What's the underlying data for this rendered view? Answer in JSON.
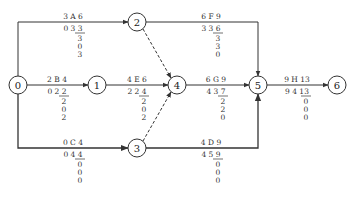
{
  "diagram": {
    "type": "activity-on-arrow network",
    "nodes": [
      {
        "id": "0",
        "x": 18,
        "y": 85
      },
      {
        "id": "1",
        "x": 97,
        "y": 85
      },
      {
        "id": "2",
        "x": 137,
        "y": 22
      },
      {
        "id": "3",
        "x": 137,
        "y": 148
      },
      {
        "id": "4",
        "x": 177,
        "y": 85
      },
      {
        "id": "5",
        "x": 258,
        "y": 85
      },
      {
        "id": "6",
        "x": 337,
        "y": 85
      }
    ],
    "activities": [
      {
        "name": "A",
        "from": "0",
        "to": "2",
        "top": "3 A 6",
        "row2_a": "0",
        "row2_b": "3",
        "row2_c": "3",
        "v1": "3",
        "v2": "0",
        "v3": "3",
        "lx": 73,
        "ly": 22
      },
      {
        "name": "B",
        "from": "0",
        "to": "1",
        "top": "2 B 4",
        "row2_a": "0",
        "row2_b": "2",
        "row2_c": "2",
        "v1": "2",
        "v2": "0",
        "v3": "2",
        "lx": 57,
        "ly": 85
      },
      {
        "name": "C",
        "from": "0",
        "to": "3",
        "top": "0 C 4",
        "row2_a": "0",
        "row2_b": "4",
        "row2_c": "4",
        "v1": "0",
        "v2": "0",
        "v3": "0",
        "lx": 73,
        "ly": 148
      },
      {
        "name": "E",
        "from": "1",
        "to": "4",
        "top": "4 E 6",
        "row2_a": "2",
        "row2_b": "2",
        "row2_c": "4",
        "v1": "2",
        "v2": "0",
        "v3": "2",
        "lx": 137,
        "ly": 85
      },
      {
        "name": "F",
        "from": "2",
        "to": "5",
        "top": "6 F 9",
        "row2_a": "3",
        "row2_b": "3",
        "row2_c": "6",
        "v1": "3",
        "v2": "3",
        "v3": "0",
        "lx": 211,
        "ly": 22
      },
      {
        "name": "G",
        "from": "4",
        "to": "5",
        "top": "6 G 9",
        "row2_a": "4",
        "row2_b": "3",
        "row2_c": "7",
        "v1": "2",
        "v2": "2",
        "v3": "0",
        "lx": 216,
        "ly": 85
      },
      {
        "name": "D",
        "from": "3",
        "to": "5",
        "top": "4 D 9",
        "row2_a": "4",
        "row2_b": "5",
        "row2_c": "9",
        "v1": "0",
        "v2": "0",
        "v3": "0",
        "lx": 211,
        "ly": 148
      },
      {
        "name": "H",
        "from": "5",
        "to": "6",
        "top": "9 H 13",
        "row2_a": "9",
        "row2_b": "4",
        "row2_c": "13",
        "v1": "0",
        "v2": "0",
        "v3": "0",
        "lx": 297,
        "ly": 85
      }
    ],
    "dummies": [
      {
        "from": "2",
        "to": "4"
      },
      {
        "from": "3",
        "to": "4"
      }
    ],
    "colors": {
      "line": "#333333",
      "node_stroke": "#333333",
      "text": "#222222"
    }
  }
}
